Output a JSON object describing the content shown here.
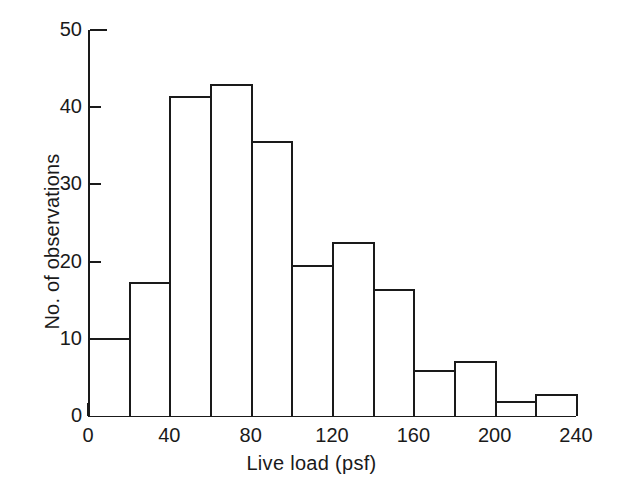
{
  "chart_data": {
    "type": "bar",
    "title": "",
    "subtitle": "",
    "xlabel": "Live load  (psf)",
    "ylabel": "No. of observations",
    "xlim": [
      0,
      240
    ],
    "ylim": [
      0,
      50
    ],
    "bin_width": 20,
    "grid": false,
    "legend": null,
    "x_ticks": [
      0,
      40,
      80,
      120,
      160,
      200,
      240
    ],
    "x_tick_labels": [
      "0",
      "40",
      "80",
      "120",
      "160",
      "200",
      "240"
    ],
    "y_ticks": [
      0,
      10,
      20,
      30,
      40,
      50
    ],
    "y_tick_labels": [
      "0",
      "10",
      "20",
      "30",
      "40",
      "50"
    ],
    "categories": [
      "0-20",
      "20-40",
      "40-60",
      "60-80",
      "80-100",
      "100-120",
      "120-140",
      "140-160",
      "160-180",
      "180-200",
      "200-220",
      "220-240"
    ],
    "bin_starts": [
      0,
      20,
      40,
      60,
      80,
      100,
      120,
      140,
      160,
      180,
      200,
      220
    ],
    "values": [
      10.1,
      17.4,
      41.5,
      43.0,
      35.6,
      19.6,
      22.6,
      16.5,
      6.0,
      7.1,
      1.9,
      2.8
    ],
    "line_color": "#1a1a1a",
    "fill_color": "#ffffff"
  }
}
